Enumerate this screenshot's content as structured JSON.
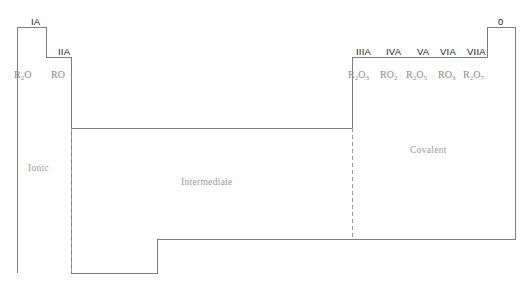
{
  "figure": {
    "type": "bonding-character-diagram",
    "line_color": "#7d7d7d",
    "dash_color": "#9b9b9b",
    "label_color": "#1a1a1a",
    "formula_color": "#8a8a8a",
    "region_color": "#9a9a9a",
    "background": "#ffffff"
  },
  "groups": [
    {
      "id": "IA",
      "label": "IA",
      "x": 31,
      "y": 17
    },
    {
      "id": "IIA",
      "label": "IIA",
      "x": 58,
      "y": 47
    },
    {
      "id": "IIIA",
      "label": "IIIA",
      "x": 362,
      "y": 47
    },
    {
      "id": "IVA",
      "label": "IVA",
      "x": 390,
      "y": 47
    },
    {
      "id": "VA",
      "label": "VA",
      "x": 419,
      "y": 47
    },
    {
      "id": "VIA",
      "label": "VIA",
      "x": 443,
      "y": 47
    },
    {
      "id": "VIIA",
      "label": "VIIA",
      "x": 470,
      "y": 47
    },
    {
      "id": "0",
      "label": "0",
      "x": 501,
      "y": 17
    }
  ],
  "formulas": [
    {
      "id": "R2O",
      "base": "R",
      "sub1": "2",
      "rest": "O",
      "sub2": "",
      "x": 14,
      "y": 70
    },
    {
      "id": "RO",
      "base": "R",
      "sub1": "",
      "rest": "O",
      "sub2": "",
      "x": 51,
      "y": 70
    },
    {
      "id": "R2O3",
      "base": "R",
      "sub1": "2",
      "rest": "O",
      "sub2": "3",
      "x": 348,
      "y": 70
    },
    {
      "id": "RO2",
      "base": "R",
      "sub1": "",
      "rest": "O",
      "sub2": "2",
      "x": 380,
      "y": 70
    },
    {
      "id": "R2O5",
      "base": "R",
      "sub1": "2",
      "rest": "O",
      "sub2": "5",
      "x": 406,
      "y": 70
    },
    {
      "id": "RO3",
      "base": "R",
      "sub1": "",
      "rest": "O",
      "sub2": "3",
      "x": 438,
      "y": 70
    },
    {
      "id": "R2O7",
      "base": "R",
      "sub1": "2",
      "rest": "O",
      "sub2": "7",
      "x": 463,
      "y": 70
    }
  ],
  "regions": [
    {
      "id": "ionic",
      "label": "Ionic",
      "x": 28,
      "y": 164
    },
    {
      "id": "intermediate",
      "label": "Intermediate",
      "x": 181,
      "y": 178
    },
    {
      "id": "covalent",
      "label": "Covalent",
      "x": 410,
      "y": 146
    }
  ],
  "outline": {
    "description": "stepped boundary enclosing the periodic-table bonding regions",
    "path": "M 17 27 L 46 27 L 46 57 L 71 57 L 71 273 L 157 273 L 157 239 L 515 239 L 515 27 L 487 27 L 487 57 L 352 57 L 352 128 L 71 128"
  },
  "dividers": [
    {
      "id": "ionic-intermediate-divider",
      "x": 71,
      "y1": 128,
      "y2": 273,
      "style": "dashed"
    },
    {
      "id": "intermediate-covalent-divider",
      "x": 352,
      "y1": 128,
      "y2": 239,
      "style": "dashed"
    }
  ]
}
